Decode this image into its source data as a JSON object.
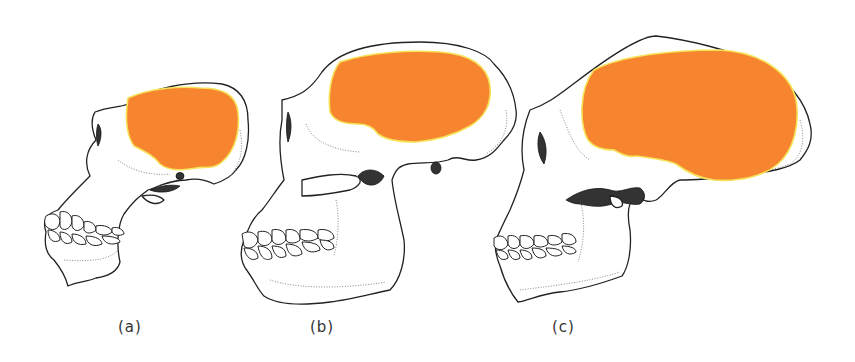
{
  "figure": {
    "background": "#ffffff",
    "brain_color": "#f7842f",
    "brain_edge_color": "#f5e35a",
    "line_color": "#222222",
    "panels": [
      {
        "id": "a",
        "label": "(a)",
        "subject": "skull-small-cranium"
      },
      {
        "id": "b",
        "label": "(b)",
        "subject": "skull-medium-cranium"
      },
      {
        "id": "c",
        "label": "(c)",
        "subject": "skull-large-cranium"
      }
    ]
  }
}
